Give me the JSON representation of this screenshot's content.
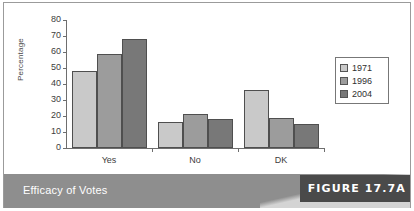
{
  "figure": {
    "caption": "Efficacy of Votes",
    "tag": "FIGURE 17.7A"
  },
  "legend": {
    "position": "right",
    "entries": [
      {
        "label": "1971",
        "color": "#c9c9c9",
        "swatch_name": "legend-swatch-1971"
      },
      {
        "label": "1996",
        "color": "#9c9c9c",
        "swatch_name": "legend-swatch-1996"
      },
      {
        "label": "2004",
        "color": "#787878",
        "swatch_name": "legend-swatch-2004"
      }
    ]
  },
  "chart_data": {
    "type": "bar",
    "title": "Efficacy of Votes",
    "xlabel": "",
    "ylabel": "Percentage",
    "categories": [
      "Yes",
      "No",
      "DK"
    ],
    "series": [
      {
        "name": "1971",
        "color": "#c9c9c9",
        "values": [
          48,
          16,
          36
        ]
      },
      {
        "name": "1996",
        "color": "#9c9c9c",
        "values": [
          59,
          21,
          19
        ]
      },
      {
        "name": "2004",
        "color": "#787878",
        "values": [
          68,
          18,
          15
        ]
      }
    ],
    "ylim": [
      0,
      80
    ],
    "yticks": [
      0,
      10,
      20,
      30,
      40,
      50,
      60,
      70,
      80
    ],
    "ytick_labels": [
      "0",
      "10",
      "20",
      "30",
      "40",
      "50",
      "60",
      "70",
      "80"
    ],
    "grid": false,
    "legend_position": "right"
  }
}
